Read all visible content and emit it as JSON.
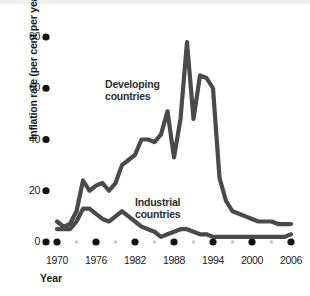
{
  "chart_data": {
    "type": "line",
    "title": "",
    "xlabel": "Year",
    "ylabel": "Inflation rate (per cent per year)",
    "xlim": [
      1970,
      2006
    ],
    "ylim": [
      0,
      80
    ],
    "yticks": [
      0,
      20,
      40,
      60,
      80
    ],
    "xticks": [
      1970,
      1976,
      1982,
      1988,
      1994,
      2000,
      2006
    ],
    "xminorticks": [
      1973,
      1979,
      1985,
      1991,
      1997,
      2003
    ],
    "grid": false,
    "legend": "inline-annotations",
    "x": [
      1970,
      1971,
      1972,
      1973,
      1974,
      1975,
      1976,
      1977,
      1978,
      1979,
      1980,
      1981,
      1982,
      1983,
      1984,
      1985,
      1986,
      1987,
      1988,
      1989,
      1990,
      1991,
      1992,
      1993,
      1994,
      1995,
      1996,
      1997,
      1998,
      1999,
      2000,
      2001,
      2002,
      2003,
      2004,
      2005,
      2006
    ],
    "series": [
      {
        "name": "Developing countries",
        "color": "#4a4a4a",
        "values": [
          8,
          6,
          7,
          12,
          24,
          20,
          22,
          23,
          20,
          23,
          30,
          32,
          34,
          40,
          40,
          39,
          42,
          51,
          33,
          48,
          78,
          48,
          65,
          64,
          60,
          25,
          16,
          12,
          11,
          10,
          9,
          8,
          8,
          8,
          7,
          7,
          7
        ]
      },
      {
        "name": "Industrial countries",
        "color": "#4a4a4a",
        "values": [
          5,
          5,
          5,
          8,
          13,
          13,
          11,
          9,
          8,
          10,
          12,
          10,
          8,
          6,
          5,
          4,
          2,
          3,
          4,
          5,
          5,
          4,
          3,
          3,
          2,
          2,
          2,
          2,
          2,
          2,
          2,
          2,
          2,
          2,
          2,
          2,
          3
        ]
      }
    ],
    "annotations": [
      {
        "text_line1": "Developing",
        "text_line2": "countries"
      },
      {
        "text_line1": "Industrial",
        "text_line2": "countries"
      }
    ]
  },
  "axis": {
    "y_title": "Inflation rate (per cent per year)",
    "x_title": "Year",
    "y_tick_labels": [
      "80",
      "60",
      "40",
      "20",
      "0"
    ],
    "x_tick_labels": [
      "1970",
      "1976",
      "1982",
      "1988",
      "1994",
      "2000",
      "2006"
    ]
  },
  "labels": {
    "developing_line1": "Developing",
    "developing_line2": "countries",
    "industrial_line1": "Industrial",
    "industrial_line2": "countries"
  },
  "colors": {
    "line": "#4a4a4a",
    "tick_major": "#111111",
    "tick_minor": "#c8c8c8",
    "text": "#1a1a1a",
    "background": "#ffffff",
    "top_band": "#eef0f1"
  }
}
